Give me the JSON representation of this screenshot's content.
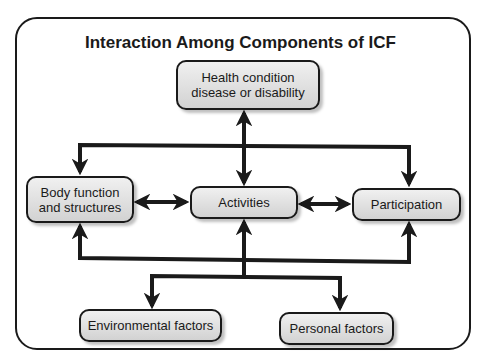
{
  "diagram": {
    "title": "Interaction Among Components of ICF",
    "nodes": {
      "health": {
        "line1": "Health condition",
        "line2": "disease or disability"
      },
      "body": {
        "line1": "Body function",
        "line2": "and structures"
      },
      "activities": {
        "label": "Activities"
      },
      "participation": {
        "label": "Participation"
      },
      "environmental": {
        "label": "Environmental factors"
      },
      "personal": {
        "label": "Personal factors"
      }
    },
    "edges": [
      {
        "from": "Health condition",
        "to": "Activities",
        "type": "bidirectional"
      },
      {
        "from": "Health condition",
        "to": "Body function and structures",
        "type": "directed"
      },
      {
        "from": "Health condition",
        "to": "Participation",
        "type": "directed"
      },
      {
        "from": "Body function and structures",
        "to": "Activities",
        "type": "bidirectional"
      },
      {
        "from": "Activities",
        "to": "Participation",
        "type": "bidirectional"
      },
      {
        "from": "Environmental/Personal bus",
        "to": "Body function and structures",
        "type": "directed"
      },
      {
        "from": "Environmental/Personal bus",
        "to": "Activities",
        "type": "directed"
      },
      {
        "from": "Environmental/Personal bus",
        "to": "Participation",
        "type": "directed"
      },
      {
        "from": "Bus",
        "to": "Environmental factors",
        "type": "directed"
      },
      {
        "from": "Bus",
        "to": "Personal factors",
        "type": "directed"
      }
    ],
    "colors": {
      "stroke": "#1a1a1a",
      "node_fill_top": "#f0f0f0",
      "node_fill_bottom": "#d2d2d2"
    }
  }
}
